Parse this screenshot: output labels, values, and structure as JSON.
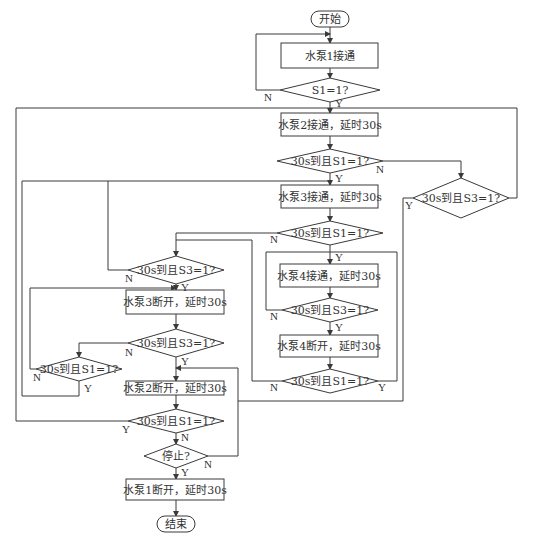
{
  "diagram": {
    "type": "flowchart",
    "caption_fragment": "",
    "colors": {
      "line": "#3a3a3a",
      "text": "#333333",
      "background": "#ffffff"
    },
    "terminals": {
      "start": "开始",
      "end": "结束"
    },
    "processes": {
      "pump1_on": "水泵1接通",
      "pump2_on": "水泵2接通，延时30s",
      "pump3_on": "水泵3接通，延时30s",
      "pump4_on": "水泵4接通，延时30s",
      "pump4_off": "水泵4断开，延时30s",
      "pump3_off": "水泵3断开，延时30s",
      "pump2_off": "水泵2断开，延时30s",
      "pump1_off": "水泵1断开，延时30s"
    },
    "decisions": {
      "d_s1": "S1=1?",
      "d2": "30s到且S1=1?",
      "d_right_s3": "30s到且S3=1?",
      "d3": "30s到且S1=1?",
      "d4_s3": "30s到且S3=1?",
      "d5": "30s到且S1=1?",
      "d_left_s3": "30s到且S3=1?",
      "d6_s3": "30s到且S3=1?",
      "d_small_s1": "30s到且S1=1?",
      "d7": "30s到且S1=1?",
      "d_stop": "停止?"
    },
    "branch_labels": {
      "yes": "Y",
      "no": "N"
    }
  }
}
